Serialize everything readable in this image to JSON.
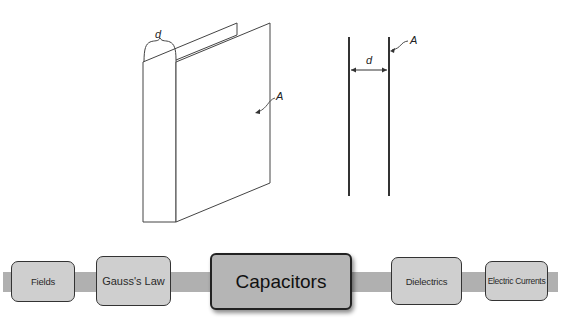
{
  "diagram": {
    "perspective_view": {
      "gap_label": "d",
      "area_label": "A"
    },
    "side_view": {
      "gap_label": "d",
      "area_label": "A"
    }
  },
  "nav": {
    "items": [
      {
        "label": "Fields",
        "current": false
      },
      {
        "label": "Gauss's Law",
        "current": false
      },
      {
        "label": "Capacitors",
        "current": true
      },
      {
        "label": "Dielectrics",
        "current": false
      },
      {
        "label": "Electric Currents",
        "current": false
      }
    ]
  },
  "colors": {
    "band": "#b0b0b0",
    "node_fill": "#cfcfcf",
    "current_node_fill": "#b5b5b5",
    "line": "#333333"
  }
}
